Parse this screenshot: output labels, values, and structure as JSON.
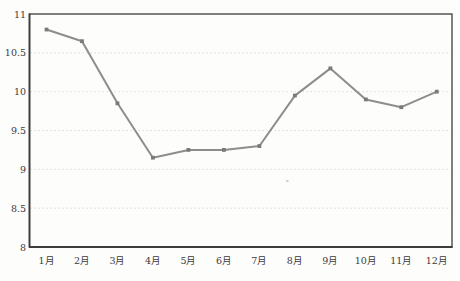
{
  "chart_data": {
    "type": "line",
    "title": "",
    "xlabel": "",
    "ylabel": "",
    "categories": [
      "1月",
      "2月",
      "3月",
      "4月",
      "5月",
      "6月",
      "7月",
      "8月",
      "9月",
      "10月",
      "11月",
      "12月"
    ],
    "series": [
      {
        "name": "monthly-value",
        "values": [
          10.8,
          10.65,
          9.85,
          9.15,
          9.25,
          9.25,
          9.3,
          9.95,
          10.3,
          9.9,
          9.8,
          10.0
        ]
      }
    ],
    "ylim": [
      8,
      11
    ],
    "ytick_step": 0.5,
    "ytick_labels": [
      "8",
      "8.5",
      "9",
      "9.5",
      "10",
      "10.5",
      "11"
    ],
    "grid": "horizontal-dotted",
    "legend_position": "none",
    "style": {
      "background_color": "#fdfdfc",
      "border_color": "#3c3c3c",
      "grid_color": "#dedad8",
      "line_color": "#8d8d8d",
      "marker_color": "#7a7a7a",
      "marker_shape": "square",
      "label_color": "#3a3a3a"
    }
  }
}
